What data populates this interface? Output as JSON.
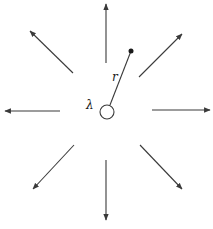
{
  "diagram": {
    "labels": {
      "charge": "λ",
      "distance": "r"
    },
    "colors": {
      "stroke": "#3a3a3a",
      "background": "#ffffff"
    },
    "charge_circle": {
      "cx": 107,
      "cy": 112,
      "r": 7
    },
    "point": {
      "cx": 131,
      "cy": 51,
      "r": 2.5
    },
    "radius_line": {
      "x1": 110,
      "y1": 105,
      "x2": 131,
      "y2": 51
    },
    "arrows": [
      {
        "name": "arrow-up",
        "x1": 106,
        "y1": 63,
        "x2": 106,
        "y2": 4
      },
      {
        "name": "arrow-down",
        "x1": 106,
        "y1": 160,
        "x2": 106,
        "y2": 220
      },
      {
        "name": "arrow-left",
        "x1": 60,
        "y1": 111,
        "x2": 5,
        "y2": 111
      },
      {
        "name": "arrow-right",
        "x1": 152,
        "y1": 110,
        "x2": 210,
        "y2": 110
      },
      {
        "name": "arrow-up-left",
        "x1": 73,
        "y1": 73,
        "x2": 30,
        "y2": 31
      },
      {
        "name": "arrow-up-right",
        "x1": 139,
        "y1": 77,
        "x2": 182,
        "y2": 34
      },
      {
        "name": "arrow-down-left",
        "x1": 74,
        "y1": 145,
        "x2": 33,
        "y2": 189
      },
      {
        "name": "arrow-down-right",
        "x1": 140,
        "y1": 145,
        "x2": 182,
        "y2": 189
      }
    ]
  }
}
